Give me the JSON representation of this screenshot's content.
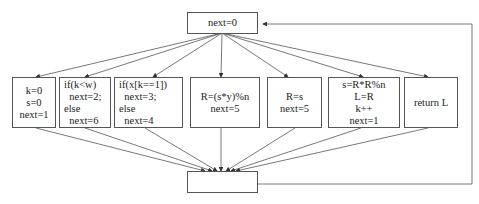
{
  "diagram": {
    "type": "flattened control-flow dispatcher",
    "top_node": {
      "label": "next=0"
    },
    "bottom_node": {
      "label": ""
    },
    "cases": [
      {
        "id": "case1",
        "lines": [
          "k=0",
          "s=0",
          "next=1"
        ]
      },
      {
        "id": "case2",
        "lines": [
          "if(k<w)",
          "  next=2;",
          "else",
          "  next=6"
        ]
      },
      {
        "id": "case3",
        "lines": [
          "if(x[k==1])",
          "  next=3;",
          "else",
          "  next=4"
        ]
      },
      {
        "id": "case4",
        "lines": [
          "R=(s*y)%n",
          "next=5"
        ]
      },
      {
        "id": "case5",
        "lines": [
          "R=s",
          "next=5"
        ]
      },
      {
        "id": "case6",
        "lines": [
          "s=R*R%n",
          "L=R",
          "k++",
          "next=1"
        ]
      },
      {
        "id": "case7",
        "lines": [
          "return L"
        ]
      }
    ],
    "edges": [
      "top_node -> each case",
      "each case -> bottom_node",
      "bottom_node -> top_node (loop back along right side)"
    ],
    "colors": {
      "stroke": "#555555",
      "background": "#ffffff",
      "text": "#222222"
    }
  }
}
